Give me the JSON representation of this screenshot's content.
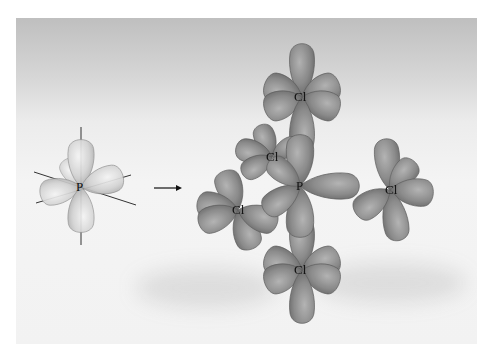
{
  "diagram": {
    "left": {
      "central_atom": "P",
      "description": "Hybrid orbitals of phosphorus with axes"
    },
    "arrow": "→",
    "right": {
      "central_atom": "P",
      "ligands": [
        "Cl",
        "Cl",
        "Cl",
        "Cl",
        "Cl"
      ]
    },
    "colors": {
      "left_orbital": "#d4d4d4",
      "right_orbital": "#8a8a8a",
      "background_top": "#bfbfbf",
      "background_bottom": "#f2f2f2"
    }
  }
}
